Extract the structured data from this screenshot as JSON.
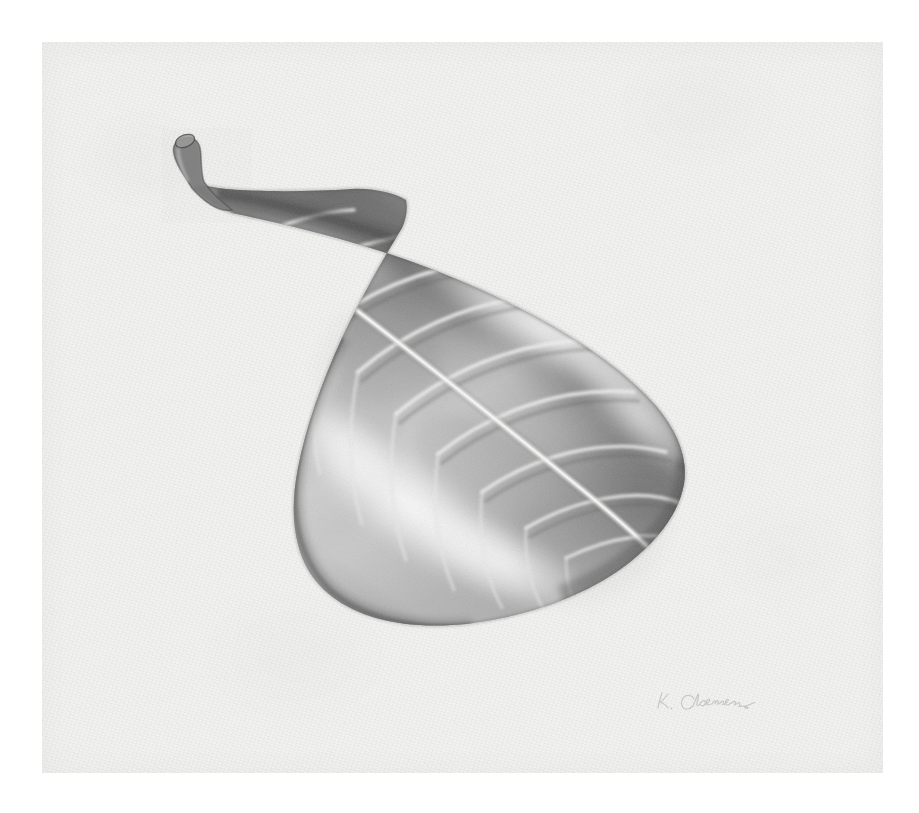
{
  "artwork": {
    "medium": "graphite pencil drawing",
    "subject": "leaf",
    "title": "Leaf Study",
    "orientation": "diagonal, base upper-left to tip lower-right",
    "paper_color": "#f1f1f0",
    "background_color": "#ffffff",
    "graphite_dark": "#4a4a4a",
    "graphite_mid": "#8d8d8d",
    "graphite_light": "#c9c9c9",
    "highlight_color": "#f6f6f5"
  },
  "paper": {
    "left": 42,
    "top": 42,
    "width": 841,
    "height": 731,
    "texture": "cold-press tooth"
  },
  "leaf": {
    "name": "single oblong-lanceolate leaf",
    "stem_label": "cut petiole",
    "tip_label": "blunt rounded apex",
    "midrib_label": "midrib",
    "vein_count": 11,
    "vein_label": "lateral vein",
    "highlight_band_label": "specular highlight band",
    "outline_points": "151,146 186,170 240,181 310,198 392,222 470,252 533,287 580,322 615,358 636,392 644,424 636,454 614,486 580,518 536,546 486,568 432,580 380,580 334,568 298,546 272,516 258,482 254,442 262,396 280,342 306,288 334,240 356,206 368,184",
    "veins": [
      {
        "id": "vein-1",
        "label": "lateral vein 1"
      },
      {
        "id": "vein-2",
        "label": "lateral vein 2"
      },
      {
        "id": "vein-3",
        "label": "lateral vein 3"
      },
      {
        "id": "vein-4",
        "label": "lateral vein 4"
      },
      {
        "id": "vein-5",
        "label": "lateral vein 5"
      },
      {
        "id": "vein-6",
        "label": "lateral vein 6"
      },
      {
        "id": "vein-7",
        "label": "lateral vein 7"
      },
      {
        "id": "vein-8",
        "label": "lateral vein 8"
      },
      {
        "id": "vein-9",
        "label": "lateral vein 9"
      },
      {
        "id": "vein-10",
        "label": "lateral vein 10"
      },
      {
        "id": "vein-11",
        "label": "lateral vein 11"
      }
    ]
  },
  "signature": {
    "text": "K. Coleman",
    "description": "faint cursive pencil signature, lower right",
    "opacity": 0.3
  }
}
